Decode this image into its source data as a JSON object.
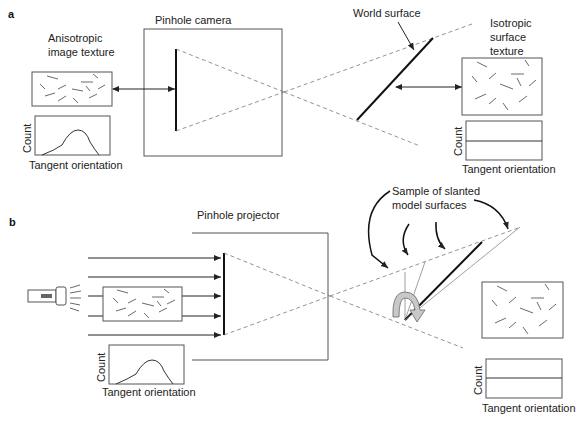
{
  "panel_a": {
    "label": "a",
    "camera_title": "Pinhole camera",
    "image_texture_label_line1": "Anisotropic",
    "image_texture_label_line2": "image texture",
    "world_surface_label": "World surface",
    "surface_texture_label_line1": "Isotropic",
    "surface_texture_label_line2": "surface",
    "surface_texture_label_line3": "texture",
    "left_hist": {
      "ylabel": "Count",
      "xlabel": "Tangent orientation",
      "shape": "peaked"
    },
    "right_hist": {
      "ylabel": "Count",
      "xlabel": "Tangent orientation",
      "shape": "flat"
    }
  },
  "panel_b": {
    "label": "b",
    "projector_title": "Pinhole projector",
    "samples_label_line1": "Sample of slanted",
    "samples_label_line2": "model surfaces",
    "left_hist": {
      "ylabel": "Count",
      "xlabel": "Tangent orientation",
      "shape": "peaked"
    },
    "right_hist": {
      "ylabel": "Count",
      "xlabel": "Tangent orientation",
      "shape": "flat"
    }
  }
}
